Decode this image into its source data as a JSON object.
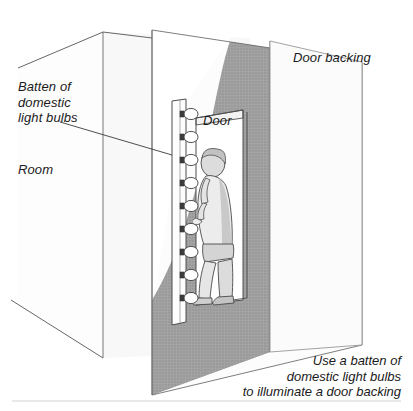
{
  "figure": {
    "background_color": "#ffffff",
    "width": 413,
    "height": 411
  },
  "labels": {
    "batten": "Batten of\ndomestic\nlight bulbs",
    "room": "Room",
    "door_backing": "Door backing",
    "door": "Door"
  },
  "caption": "Use a batten of\ndomestic light bulbs\nto illuminate a door backing",
  "colors": {
    "ink": "#1a1a1a",
    "line": "#4d4d4d",
    "thin_line": "#7a7a7a",
    "room_wall": "#f7f7f7",
    "room_wall_side": "#fbfbfb",
    "backing_panel": "#fcfcfc",
    "shadow_gray": "#a0a0a0",
    "shadow_gray_dark": "#8f8f8f",
    "light_wedge": "#ffffff",
    "figure_fill": "#e8e8e8",
    "figure_shade": "#b8b8b8",
    "batten_fill": "#fdfdfd",
    "bulb_fill": "#ffffff",
    "rule": "#cfcfcf"
  },
  "scene": {
    "bulb_count": 9,
    "bulb_positions_y": [
      114,
      137,
      160,
      183,
      206,
      229,
      252,
      275,
      298
    ],
    "batten_x": 178,
    "description": "Isometric line drawing of a room with an open door, a vertical batten of nine light bulbs mounted beside the doorway, a person standing in the doorway, and a large door backing panel behind casting a light wedge."
  }
}
